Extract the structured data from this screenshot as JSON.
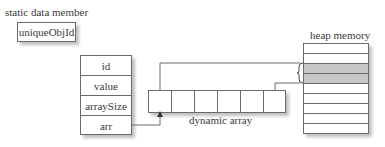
{
  "static_member": {
    "caption": "static data member",
    "name": "uniqueObjId"
  },
  "object": {
    "fields": [
      "id",
      "value",
      "arraySize",
      "arr"
    ]
  },
  "dynamic_array": {
    "caption": "dynamic array",
    "cell_count": 6
  },
  "heap": {
    "caption": "heap memory",
    "row_count": 9,
    "allocated_rows": [
      2,
      3
    ]
  },
  "colors": {
    "line": "#6a6a6a",
    "allocated": "#c8c8c8"
  }
}
